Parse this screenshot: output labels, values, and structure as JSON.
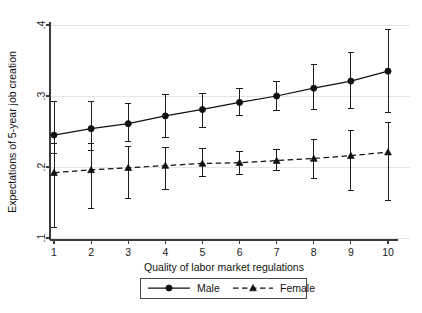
{
  "chart_data": {
    "type": "line",
    "title": "",
    "subtitle": "",
    "xlabel": "Quality of labor market regulations",
    "ylabel": "Expectations of 5-year job creation",
    "x": [
      1,
      2,
      3,
      4,
      5,
      6,
      7,
      8,
      9,
      10
    ],
    "xticklabels": [
      "1",
      "2",
      "3",
      "4",
      "5",
      "6",
      "7",
      "8",
      "9",
      "10"
    ],
    "yticklabels": [
      ".1",
      ".2",
      ".3",
      ".4"
    ],
    "ytickvalues": [
      0.1,
      0.2,
      0.3,
      0.4
    ],
    "xlim": [
      0.6,
      10.5
    ],
    "ylim": [
      0.1,
      0.4
    ],
    "grid": "horizontal",
    "legend_position": "below-axis-center",
    "error_bars": "vertical capped intervals",
    "series": [
      {
        "name": "Male",
        "marker": "circle",
        "linestyle": "solid",
        "color": "#111111",
        "values": [
          0.245,
          0.254,
          0.261,
          0.272,
          0.281,
          0.291,
          0.3,
          0.311,
          0.321,
          0.335
        ],
        "err_low": [
          0.219,
          0.223,
          0.236,
          0.242,
          0.256,
          0.272,
          0.279,
          0.281,
          0.283,
          0.277
        ],
        "err_high": [
          0.292,
          0.292,
          0.29,
          0.302,
          0.304,
          0.31,
          0.32,
          0.344,
          0.361,
          0.394
        ]
      },
      {
        "name": "Female",
        "marker": "triangle",
        "linestyle": "dashed",
        "color": "#111111",
        "values": [
          0.192,
          0.196,
          0.199,
          0.202,
          0.205,
          0.206,
          0.209,
          0.212,
          0.216,
          0.221
        ],
        "err_low": [
          0.115,
          0.141,
          0.156,
          0.169,
          0.186,
          0.19,
          0.195,
          0.184,
          0.167,
          0.153
        ],
        "err_high": [
          0.233,
          0.233,
          0.229,
          0.228,
          0.226,
          0.222,
          0.224,
          0.239,
          0.251,
          0.262
        ]
      }
    ],
    "legend": [
      {
        "label": "Male",
        "marker": "circle",
        "linestyle": "solid"
      },
      {
        "label": "Female",
        "marker": "triangle",
        "linestyle": "dashed"
      }
    ]
  },
  "figure": {
    "background": "#ffffff",
    "axis_color": "#3a3a3a",
    "ink_color": "#111111",
    "grid_color": "#e2e2e2"
  }
}
